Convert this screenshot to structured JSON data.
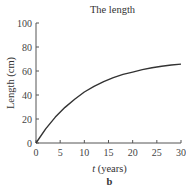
{
  "chart_data": {
    "type": "line",
    "title": "The length",
    "xlabel_var": "t",
    "xlabel_unit": "(years)",
    "xlabel": "t (years)",
    "ylabel": "Length (cm)",
    "panel_label": "b",
    "xlim": [
      0,
      30
    ],
    "ylim": [
      0,
      100
    ],
    "xticks": [
      0,
      5,
      10,
      15,
      20,
      25,
      30
    ],
    "yticks": [
      0,
      20,
      40,
      60,
      80,
      100
    ],
    "grid": false,
    "legend": null,
    "series": [
      {
        "name": "Length",
        "x": [
          0,
          2,
          4,
          6,
          8,
          10,
          12,
          14,
          16,
          18,
          20,
          22,
          24,
          26,
          28,
          30
        ],
        "values": [
          0,
          11.8,
          21.6,
          29.7,
          36.5,
          42.5,
          47.2,
          51.2,
          54.5,
          57.2,
          59.1,
          61.1,
          62.7,
          64.0,
          65.0,
          65.7
        ]
      }
    ],
    "line_color": "#333333"
  }
}
